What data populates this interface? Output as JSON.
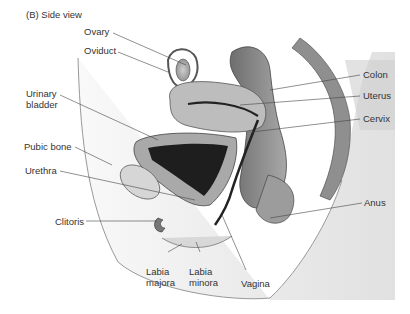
{
  "title": "(B)  Side view",
  "labels": {
    "ovary": "Ovary",
    "oviduct": "Oviduct",
    "urinary_bladder": [
      "Urinary",
      "bladder"
    ],
    "pubic_bone": "Pubic bone",
    "urethra": "Urethra",
    "clitoris": "Clitoris",
    "labia_majora": [
      "Labia",
      "majora"
    ],
    "labia_minora": [
      "Labia",
      "minora"
    ],
    "vagina": "Vagina",
    "colon": "Colon",
    "uterus": "Uterus",
    "cervix": "Cervix",
    "anus": "Anus"
  }
}
